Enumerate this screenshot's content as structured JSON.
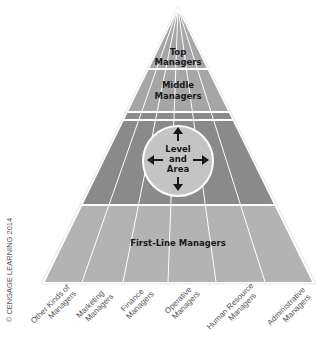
{
  "diagram": {
    "tiers": [
      {
        "id": "top",
        "label_line1": "Top",
        "label_line2": "Managers"
      },
      {
        "id": "middle",
        "label_line1": "Middle",
        "label_line2": "Managers"
      },
      {
        "id": "level-area",
        "label_line1": "Level",
        "label_line2": "and",
        "label_line3": "Area"
      },
      {
        "id": "first-line",
        "label_line1": "First-Line Managers"
      }
    ],
    "areas": [
      {
        "line1": "Other Kinds of",
        "line2": "Managers"
      },
      {
        "line1": "Marketing",
        "line2": "Managers"
      },
      {
        "line1": "Finance",
        "line2": "Managers"
      },
      {
        "line1": "Operative",
        "line2": "Managers"
      },
      {
        "line1": "Human Resource",
        "line2": "Managers"
      },
      {
        "line1": "Administrative",
        "line2": "Managers"
      }
    ],
    "copyright": "© CENGAGE LEARNING 2014",
    "colors": {
      "top_fill": "#a6a6a6",
      "middle_fill": "#a6a6a6",
      "level_fill": "#8a8a8a",
      "first_line_fill": "#b3b3b3",
      "circle_fill": "#c4c4c4",
      "divider": "#ffffff",
      "text": "#1a1a1a"
    }
  }
}
